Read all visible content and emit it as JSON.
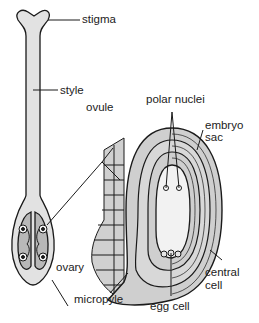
{
  "diagram": {
    "labels": {
      "stigma": "stigma",
      "style": "style",
      "ovule": "ovule",
      "ovary": "ovary",
      "micropyle": "micropyle",
      "polar_nuclei": "polar nuclei",
      "embryo_sac_line1": "embryo",
      "embryo_sac_line2": "sac",
      "central_cell_line1": "central",
      "central_cell_line2": "cell",
      "egg_cell": "egg cell"
    },
    "colors": {
      "fill_gray": "#d4d4d4",
      "fill_light": "#ededed",
      "stroke": "#1a1a1a",
      "cell_fill": "#cfcfcf",
      "background": "#ffffff"
    }
  }
}
